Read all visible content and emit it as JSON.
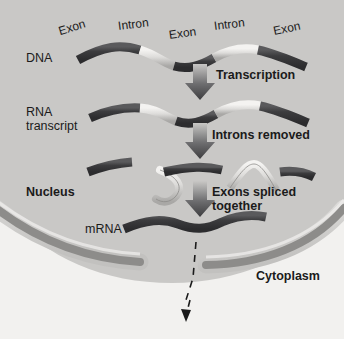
{
  "diagram": {
    "type": "biology-process-diagram",
    "colors": {
      "page_background": "#f2f1ef",
      "nucleus_fill": "#c9c8c6",
      "envelope_outer": "#d8d7d5",
      "envelope_inner": "#8d8c8a",
      "exon_dark": "#3a3a3c",
      "intron_light": "#d9d8d6",
      "arrow_dark": "#4a4a4c",
      "text": "#1b1b1b"
    }
  },
  "regions": {
    "nucleus_label": "Nucleus",
    "cytoplasm_label": "Cytoplasm"
  },
  "row_labels": {
    "dna": "DNA",
    "rna_transcript_line1": "RNA",
    "rna_transcript_line2": "transcript",
    "mrna": "mRNA"
  },
  "segment_labels": [
    {
      "text": "Exon",
      "name": "exon-label-1"
    },
    {
      "text": "Intron",
      "name": "intron-label-1"
    },
    {
      "text": "Exon",
      "name": "exon-label-2"
    },
    {
      "text": "Intron",
      "name": "intron-label-2"
    },
    {
      "text": "Exon",
      "name": "exon-label-3"
    }
  ],
  "steps": [
    {
      "name": "transcription",
      "label": "Transcription"
    },
    {
      "name": "introns-removed",
      "label": "Introns removed"
    },
    {
      "name": "exons-spliced",
      "line1": "Exons spliced",
      "line2": "together"
    }
  ],
  "strands": {
    "dna": {
      "segments": [
        "exon",
        "intron",
        "exon",
        "intron",
        "exon"
      ]
    },
    "rna_transcript": {
      "segments": [
        "exon",
        "intron",
        "exon",
        "intron",
        "exon"
      ]
    },
    "cut": {
      "exon_fragments": 3,
      "excised_introns": 2
    },
    "mrna": {
      "segments": [
        "exon",
        "exon",
        "exon"
      ],
      "spliced": true
    }
  },
  "export_arrow": {
    "name": "mrna-export-arrow",
    "style": "dashed",
    "direction": "down-left"
  }
}
